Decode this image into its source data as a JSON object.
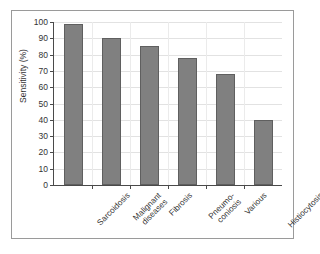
{
  "chart_data": {
    "type": "bar",
    "title": "",
    "subtitle": "",
    "xlabel": "",
    "ylabel": "Sensitivity (%)",
    "categories": [
      "Sarcoidosis",
      "Malignant\ndiseases",
      "Fibrosis",
      "Pneumo-\nconiosis",
      "Various",
      "Histiocytosis X"
    ],
    "values": [
      99,
      90,
      85,
      78,
      68,
      40
    ],
    "ylim": [
      0,
      100
    ],
    "ytick_labels": [
      "0",
      "10",
      "20",
      "30",
      "40",
      "50",
      "60",
      "70",
      "80",
      "90",
      "100"
    ],
    "ytick_values": [
      0,
      10,
      20,
      30,
      40,
      50,
      60,
      70,
      80,
      90,
      100
    ],
    "grid": true,
    "legend": false,
    "legend_position": "none",
    "bar_color": "#808080",
    "bar_edge_color": "#5f5f5f",
    "axis_color": "#4a4a4a",
    "grid_color": "#e2e2e2",
    "frame_color": "#9a9a9a",
    "background_color": "#ffffff"
  }
}
